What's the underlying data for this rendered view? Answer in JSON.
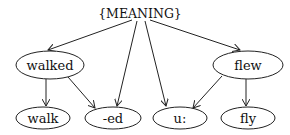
{
  "diagram": {
    "type": "directed-graph",
    "root": {
      "id": "meaning",
      "label": "{MEANING}",
      "x": 140,
      "y": 14
    },
    "nodes": [
      {
        "id": "walked",
        "label": "walked",
        "cx": 50,
        "cy": 65,
        "rx": 34,
        "ry": 14
      },
      {
        "id": "flew",
        "label": "flew",
        "cx": 248,
        "cy": 65,
        "rx": 35,
        "ry": 14
      },
      {
        "id": "walk",
        "label": "walk",
        "cx": 43,
        "cy": 118,
        "rx": 27,
        "ry": 11
      },
      {
        "id": "ed",
        "label": "-ed",
        "cx": 113,
        "cy": 118,
        "rx": 28,
        "ry": 11
      },
      {
        "id": "u",
        "label": "u:",
        "cx": 180,
        "cy": 118,
        "rx": 27,
        "ry": 11
      },
      {
        "id": "fly",
        "label": "fly",
        "cx": 248,
        "cy": 118,
        "rx": 27,
        "ry": 11
      }
    ],
    "edges": [
      {
        "from": "meaning",
        "to": "walked"
      },
      {
        "from": "meaning",
        "to": "ed"
      },
      {
        "from": "meaning",
        "to": "u"
      },
      {
        "from": "meaning",
        "to": "flew"
      },
      {
        "from": "walked",
        "to": "walk"
      },
      {
        "from": "walked",
        "to": "ed"
      },
      {
        "from": "flew",
        "to": "u"
      },
      {
        "from": "flew",
        "to": "fly"
      }
    ]
  }
}
